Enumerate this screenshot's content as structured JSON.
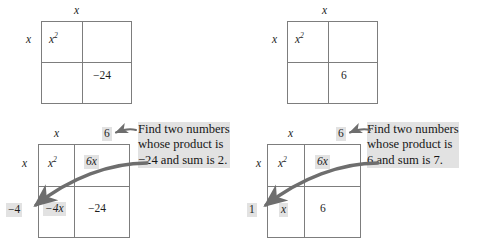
{
  "figure": {
    "background_color": "#ffffff",
    "grid_line_color": "#7d7d7d",
    "arrow_color": "#6e6e6e",
    "highlight_color": "#e2e2e2",
    "text_color": "#1a1a1a"
  },
  "panels": [
    {
      "id": "top-left",
      "name": "incomplete-box-minus24",
      "top_label": "x",
      "left_label": "x",
      "cells": {
        "top_left": "x",
        "top_left_exponent": "2",
        "top_right": "",
        "bottom_left": "",
        "bottom_right": "−24"
      }
    },
    {
      "id": "top-right",
      "name": "incomplete-box-six",
      "top_label": "x",
      "left_label": "x",
      "cells": {
        "top_left": "x",
        "top_left_exponent": "2",
        "top_right": "",
        "bottom_left": "",
        "bottom_right": "6"
      }
    },
    {
      "id": "bottom-left",
      "name": "completed-box-minus24",
      "top_label_left": "x",
      "top_label_right": "6",
      "left_label_top": "x",
      "left_label_bottom": "−4",
      "cells": {
        "top_left": "x",
        "top_left_exponent": "2",
        "top_right": "6x",
        "bottom_left": "−4x",
        "bottom_right": "−24"
      },
      "callout": {
        "line1": "Find two numbers",
        "line2": "whose product is",
        "line3": "−24 and sum is 2."
      }
    },
    {
      "id": "bottom-right",
      "name": "completed-box-six",
      "top_label_left": "x",
      "top_label_right": "6",
      "left_label_top": "x",
      "left_label_bottom": "1",
      "cells": {
        "top_left": "x",
        "top_left_exponent": "2",
        "top_right": "6x",
        "bottom_left": "x",
        "bottom_right": "6"
      },
      "callout": {
        "line1": "Find two numbers",
        "line2": "whose product is",
        "line3": "6 and sum is 7."
      }
    }
  ]
}
